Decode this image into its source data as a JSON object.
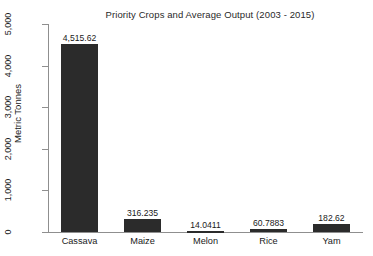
{
  "chart_data": {
    "type": "bar",
    "title": "Priority Crops and Average Output (2003 - 2015)",
    "xlabel": "",
    "ylabel": "Metric Tonnes",
    "categories": [
      "Cassava",
      "Maize",
      "Melon",
      "Rice",
      "Yam"
    ],
    "values": [
      4515.62,
      316.235,
      14.0411,
      60.7883,
      182.62
    ],
    "value_labels": [
      "4,515.62",
      "316.235",
      "14.0411",
      "60.7883",
      "182.62"
    ],
    "ylim": [
      0,
      5000
    ],
    "ytick_values": [
      0,
      1000,
      2000,
      3000,
      4000,
      5000
    ],
    "ytick_labels": [
      "0",
      "1,000",
      "2,000",
      "3,000",
      "4,000",
      "5,000"
    ],
    "grid": false,
    "legend": false,
    "bar_color": "#2b2b2b",
    "axis_color": "#8f8f8f",
    "background": "#ffffff"
  }
}
